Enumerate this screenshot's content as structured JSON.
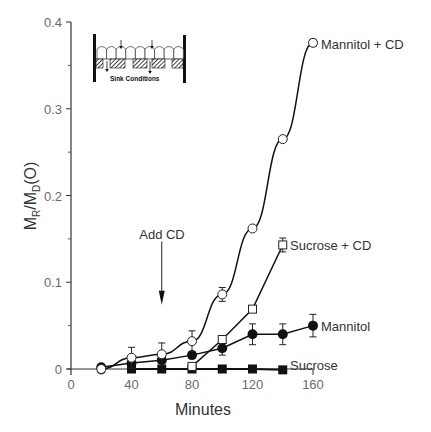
{
  "chart_data": {
    "type": "line",
    "title": "",
    "xlabel": "Minutes",
    "ylabel": "M_R/M_D(O)",
    "ylabel_parts": {
      "main1": "M",
      "sub1": "R",
      "slash": "/",
      "main2": "M",
      "sub2": "D",
      "tail": "(O)"
    },
    "xlim": [
      0,
      160
    ],
    "ylim": [
      0,
      0.4
    ],
    "x_ticks": [
      0,
      40,
      80,
      120,
      160
    ],
    "x_tick_labels": [
      "0",
      "40",
      "80",
      "120",
      "160"
    ],
    "y_ticks": [
      0,
      0.1,
      0.2,
      0.3,
      0.4
    ],
    "y_tick_labels": [
      "0",
      "0.1",
      "0.2",
      "0.3",
      "0.4"
    ],
    "y_minor_ticks": [
      0.05,
      0.15,
      0.25,
      0.35
    ],
    "grid": false,
    "legend": "inline labels at series ends",
    "series": [
      {
        "name": "Mannitol + CD",
        "marker": "open-circle",
        "x": [
          20,
          40,
          60,
          80,
          100,
          120,
          140,
          160
        ],
        "values": [
          0.0,
          0.013,
          0.017,
          0.032,
          0.086,
          0.162,
          0.265,
          0.376
        ],
        "error": [
          0.003,
          0.012,
          0.013,
          0.012,
          0.008,
          0.003,
          0.002,
          0.004
        ]
      },
      {
        "name": "Sucrose + CD",
        "marker": "open-square",
        "x": [
          80,
          100,
          120,
          140
        ],
        "values": [
          0.003,
          0.034,
          0.069,
          0.143
        ],
        "error": [
          0.002,
          0.004,
          0.003,
          0.008
        ]
      },
      {
        "name": "Mannitol",
        "marker": "filled-circle",
        "x": [
          20,
          40,
          60,
          80,
          100,
          120,
          140,
          160
        ],
        "values": [
          0.002,
          0.007,
          0.01,
          0.016,
          0.024,
          0.04,
          0.04,
          0.05
        ],
        "error": [
          0.001,
          0.003,
          0.003,
          0.003,
          0.008,
          0.012,
          0.012,
          0.013
        ]
      },
      {
        "name": "Sucrose",
        "marker": "filled-square",
        "x": [
          40,
          60,
          80,
          100,
          120,
          140
        ],
        "values": [
          0.0,
          0.0,
          0.0,
          0.0,
          0.0,
          -0.001
        ],
        "error": [
          0,
          0,
          0,
          0,
          0,
          0
        ]
      }
    ],
    "annotations": [
      {
        "text": "Add CD",
        "type": "arrow-down",
        "x": 60,
        "y_top": 0.147,
        "y_bottom": 0.074
      }
    ],
    "inset": {
      "description": "Schematic of epithelial cell monolayer on porous filter with arrows indicating transport",
      "label": "Sink Conditions"
    }
  },
  "colors": {
    "line": "#111111",
    "axis": "#333333",
    "tick_text": "#6a6a6a"
  }
}
